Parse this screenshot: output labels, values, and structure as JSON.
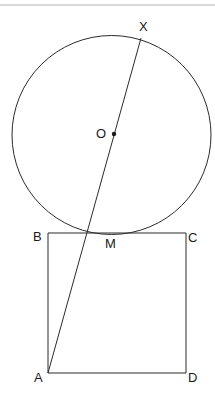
{
  "figure": {
    "background_color": "#ffffff",
    "stroke_color": "#2b2b2b",
    "rule_color": "#b4b4b4",
    "width": 215,
    "height": 404
  },
  "top_rule": {
    "name": "horizontal-rule",
    "y": 5,
    "x1": 0,
    "x2": 215
  },
  "circle": {
    "name": "circle",
    "cx": 111.5,
    "cy": 135,
    "r": 99.5,
    "stroke_width": 1
  },
  "center_point": {
    "name": "center-dot",
    "cx": 114,
    "cy": 134,
    "r": 2.2
  },
  "chord_line": {
    "name": "line-a-x",
    "x1": 48,
    "y1": 373,
    "x2": 141,
    "y2": 38,
    "stroke_width": 1
  },
  "square": {
    "name": "square-abcd",
    "stroke_width": 1,
    "vertices": {
      "B": {
        "x": 48,
        "y": 233
      },
      "C": {
        "x": 186,
        "y": 233
      },
      "D": {
        "x": 186,
        "y": 373
      },
      "A": {
        "x": 48,
        "y": 373
      }
    }
  },
  "labels": [
    {
      "key": "X",
      "text": "X",
      "x": 139,
      "y": 20
    },
    {
      "key": "O",
      "text": "O",
      "x": 96,
      "y": 127
    },
    {
      "key": "B",
      "text": "B",
      "x": 33,
      "y": 230
    },
    {
      "key": "M",
      "text": "M",
      "x": 105,
      "y": 237
    },
    {
      "key": "C",
      "text": "C",
      "x": 188,
      "y": 231
    },
    {
      "key": "A",
      "text": "A",
      "x": 34,
      "y": 371
    },
    {
      "key": "D",
      "text": "D",
      "x": 188,
      "y": 371
    }
  ],
  "chart_data": {
    "type": "diagram",
    "points": {
      "X": "point where the line meets the circle on the upper right arc",
      "O": "center of the circle",
      "M": "intersection of line AX with side BC of the square",
      "A": "bottom-left vertex of the square",
      "B": "top-left vertex of the square",
      "C": "top-right vertex of the square",
      "D": "bottom-right vertex of the square"
    }
  }
}
